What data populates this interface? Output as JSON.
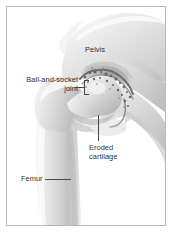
{
  "figure": {
    "style": "grayscale-pencil-shaded-anatomical-drawing",
    "frame_color": "#b9b9b9",
    "background_color": "#ffffff",
    "label_color": "#303030",
    "leader_color": "#4a4a4a"
  },
  "labels": {
    "pelvis": "Pelvis",
    "ball_and_socket_joint": "Ball-and-socket joint",
    "eroded_cartilage": "Eroded cartilage",
    "femur": "Femur"
  },
  "structures": [
    {
      "name": "pelvis",
      "label": "Pelvis",
      "description": "Broad light-gray iliac bone occupying upper-right of the frame"
    },
    {
      "name": "acetabulum-femoral-head",
      "label": "Ball-and-socket joint",
      "description": "Rounded femoral head seated in the acetabular socket at center"
    },
    {
      "name": "eroded-cartilage",
      "label": "Eroded cartilage",
      "description": "Dark mottled irregular joint-space texture showing cartilage loss"
    },
    {
      "name": "femur",
      "label": "Femur",
      "description": "Thigh bone with greater trochanter and tapering shaft at lower-left"
    }
  ]
}
